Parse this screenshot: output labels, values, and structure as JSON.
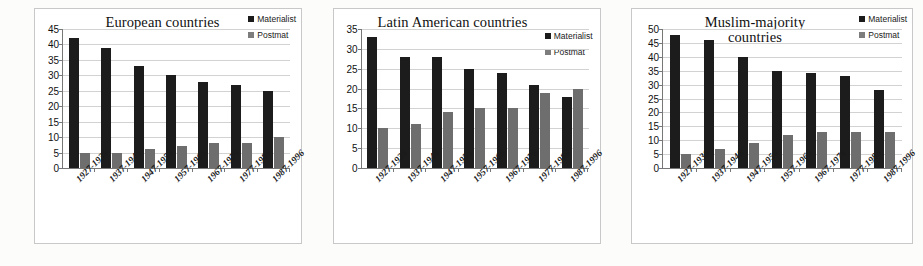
{
  "figure": {
    "categories": [
      "1927-1936",
      "1937-1946",
      "1947-1956",
      "1957-1966",
      "1967-1976",
      "1977-1986",
      "1987-1996"
    ],
    "series_names": {
      "materialist": "Materialist",
      "postmat": "Postmat"
    },
    "colors": {
      "materialist": "#1c1c1c",
      "postmat": "#6e6e6e",
      "grid": "#d2d2d2",
      "axis": "#777777",
      "panel_border": "#c8c8c8",
      "background": "#ffffff"
    }
  },
  "chart_data": [
    {
      "type": "bar",
      "title": "European countries",
      "xlabel": "",
      "ylabel": "",
      "ylim": [
        0,
        45
      ],
      "yticks": [
        0,
        5,
        10,
        15,
        20,
        25,
        30,
        35,
        40,
        45
      ],
      "grid": true,
      "legend_position": "top-right",
      "categories": [
        "1927-1936",
        "1937-1946",
        "1947-1956",
        "1957-1966",
        "1967-1976",
        "1977-1986",
        "1987-1996"
      ],
      "series": [
        {
          "name": "Materialist",
          "values": [
            42,
            39,
            33,
            30,
            28,
            27,
            25
          ]
        },
        {
          "name": "Postmat",
          "values": [
            5,
            5,
            6,
            7,
            8,
            8,
            10
          ]
        }
      ]
    },
    {
      "type": "bar",
      "title": "Latin American countries",
      "xlabel": "",
      "ylabel": "",
      "ylim": [
        0,
        35
      ],
      "yticks": [
        0,
        5,
        10,
        15,
        20,
        25,
        30,
        35
      ],
      "grid": true,
      "legend_position": "top-right",
      "categories": [
        "1927-1936",
        "1937-1946",
        "1947-1956",
        "1957-1966",
        "1967-1976",
        "1977-1986",
        "1987-1996"
      ],
      "series": [
        {
          "name": "Materialist",
          "values": [
            33,
            28,
            28,
            25,
            24,
            21,
            18
          ]
        },
        {
          "name": "Postmat",
          "values": [
            10,
            11,
            14,
            15,
            15,
            19,
            20
          ]
        }
      ]
    },
    {
      "type": "bar",
      "title": "Muslim-majority countries",
      "xlabel": "",
      "ylabel": "",
      "ylim": [
        0,
        50
      ],
      "yticks": [
        0,
        5,
        10,
        15,
        20,
        25,
        30,
        35,
        40,
        45,
        50
      ],
      "grid": true,
      "legend_position": "top-right",
      "categories": [
        "1927-1936",
        "1937-1946",
        "1947-1956",
        "1957-1966",
        "1967-1976",
        "1977-1986",
        "1987-1996"
      ],
      "series": [
        {
          "name": "Materialist",
          "values": [
            48,
            46,
            40,
            35,
            34,
            33,
            28
          ]
        },
        {
          "name": "Postmat",
          "values": [
            5,
            7,
            9,
            12,
            13,
            13,
            13
          ]
        }
      ]
    }
  ]
}
